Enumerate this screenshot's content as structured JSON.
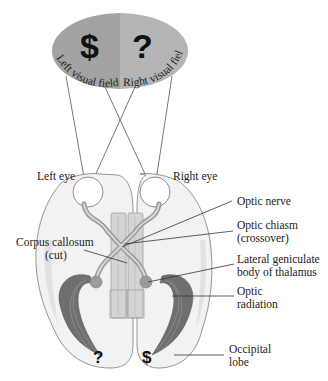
{
  "figure": {
    "visual_field": {
      "left_label": "Left visual field",
      "right_label": "Right visual field",
      "left_symbol": "$",
      "right_symbol": "?",
      "left_color": "#a3a3a3",
      "right_color": "#b5b5b5"
    },
    "labels": {
      "left_eye": "Left eye",
      "right_eye": "Right eye",
      "optic_nerve": "Optic nerve",
      "optic_chiasm_line1": "Optic chiasm",
      "optic_chiasm_line2": "(crossover)",
      "corpus_callosum_line1": "Corpus callosum",
      "corpus_callosum_line2": "(cut)",
      "lgn_line1": "Lateral geniculate",
      "lgn_line2": "body of thalamus",
      "optic_radiation_line1": "Optic",
      "optic_radiation_line2": "radiation",
      "occipital_line1": "Occipital",
      "occipital_line2": "lobe"
    },
    "occipital_symbols": {
      "left_hemisphere": "?",
      "right_hemisphere": "$"
    }
  }
}
